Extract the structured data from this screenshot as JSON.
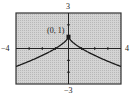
{
  "chart_data": {
    "type": "line",
    "title": "",
    "xlabel": "",
    "ylabel": "",
    "function": "y = 1 - x^(2/3)",
    "xlim": [
      -4,
      4
    ],
    "ylim": [
      -3,
      3
    ],
    "x_tick_step": 1,
    "y_tick_step": 1,
    "grid": false,
    "background_color": "#c8c8c8",
    "curve_color": "#1a1a1a",
    "x": [
      -4,
      -3,
      -2,
      -1,
      -0.5,
      0,
      0.5,
      1,
      2,
      3,
      4
    ],
    "y": [
      -1.52,
      -1.08,
      -0.59,
      0,
      0.37,
      1,
      0.37,
      0,
      -0.59,
      -1.08,
      -1.52
    ],
    "annotations": [
      {
        "text": "(0, 1)",
        "x": 0,
        "y": 1,
        "marker": "point"
      }
    ],
    "axis_labels": {
      "xmin": "−4",
      "xmax": "4",
      "ymin": "−3",
      "ymax": "3"
    }
  }
}
